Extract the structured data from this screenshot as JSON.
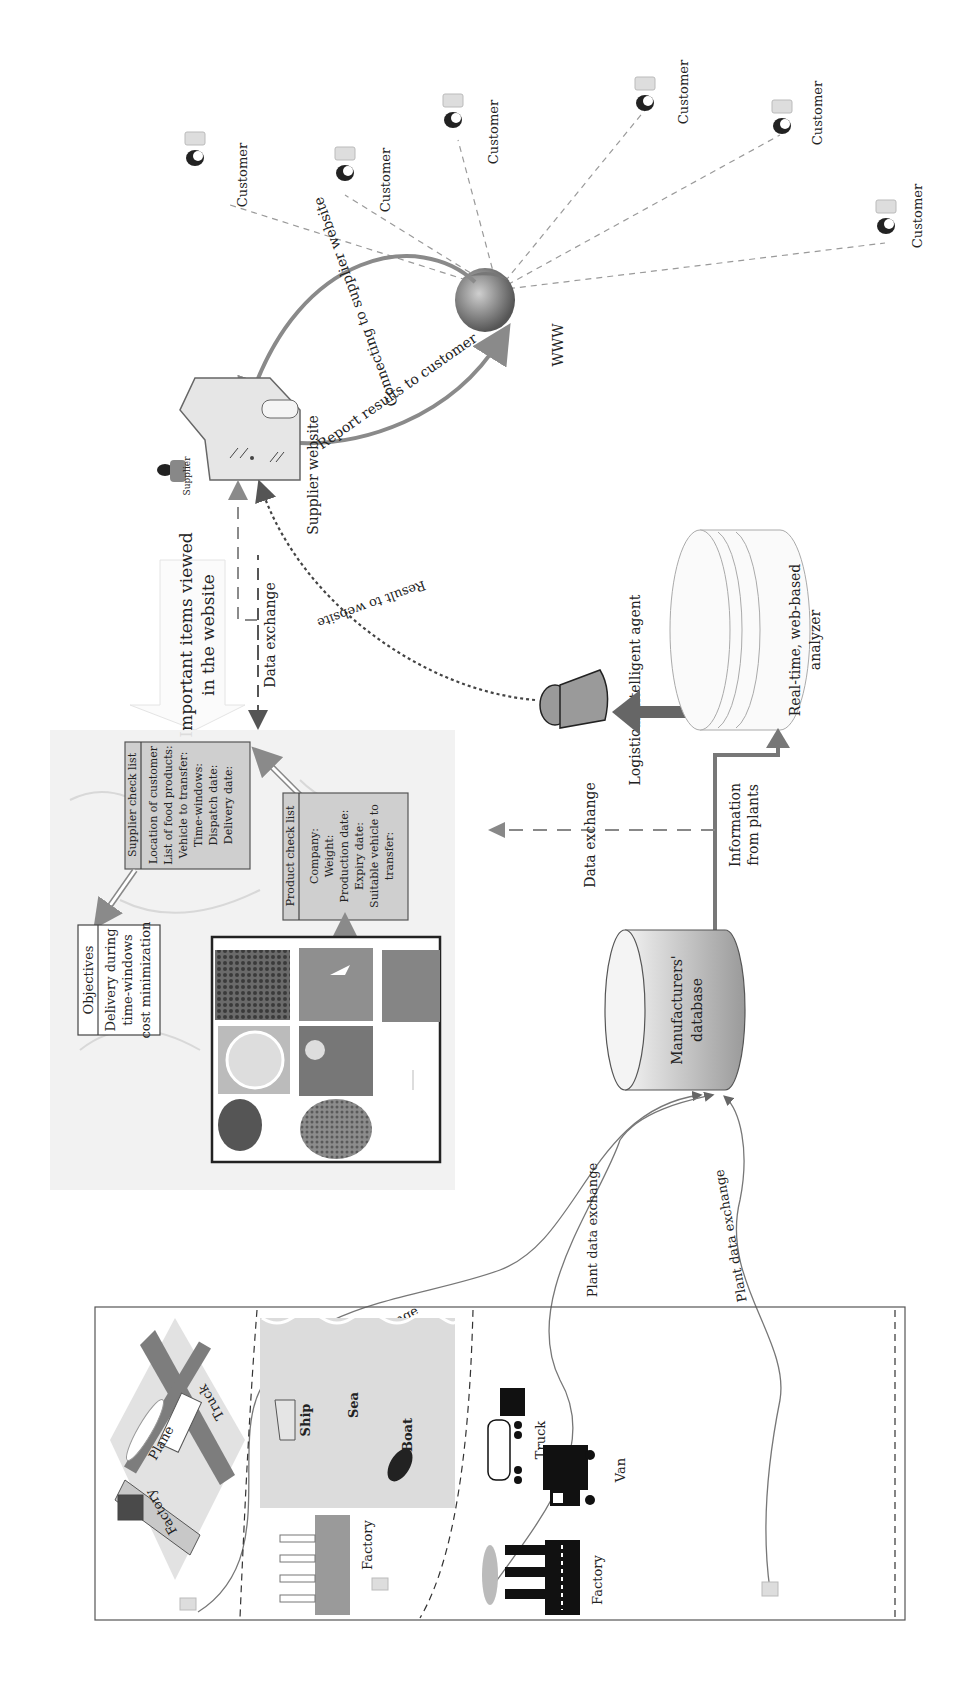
{
  "customers": {
    "label": "Customer",
    "items": [
      {
        "label": "Customer"
      },
      {
        "label": "Customer"
      },
      {
        "label": "Customer"
      },
      {
        "label": "Customer"
      },
      {
        "label": "Customer"
      },
      {
        "label": "Customer"
      }
    ]
  },
  "www": {
    "label": "WWW"
  },
  "arcs": {
    "connecting": "Connecting to supplier website",
    "report": "Report results to customer"
  },
  "supplier": {
    "icon_label": "Supplier",
    "website_label": "Supplier website"
  },
  "important_items": {
    "line1": "Important items viewed",
    "line2": "in the website"
  },
  "data_exchange_top": "Data exchange",
  "result_to_website": "Result to website",
  "agent": {
    "label": "Logistical intelligent agent"
  },
  "analyzer": {
    "line1": "Real-time, web-based",
    "line2": "analyzer"
  },
  "information_from_plants": {
    "line1": "Information",
    "line2": "from plants"
  },
  "data_exchange_mid": "Data exchange",
  "manufacturers_db": {
    "line1": "Manufacturers'",
    "line2": "database"
  },
  "supplier_checklist": {
    "title": "Supplier check list",
    "items": [
      "Location of customer",
      "List of food products:",
      "Vehicle to transfer:",
      "Time-windows:",
      "Dispatch date:",
      "Delivery date:"
    ]
  },
  "product_checklist": {
    "title": "Product check list",
    "items": [
      "Company:",
      "Weight:",
      "Production date:",
      "Expiry date:",
      "Suitable vehicle to",
      "transfer:"
    ]
  },
  "objectives": {
    "title": "Objectives",
    "items": [
      "Delivery during",
      "time-windows",
      "cost minimization"
    ]
  },
  "plant_links": [
    {
      "label": "Plant data exchange"
    },
    {
      "label": "Plant data exchange"
    },
    {
      "label": "Plant data exchange"
    }
  ],
  "zone_air": {
    "factory": "Factory",
    "plane": "Plane",
    "truck": "Truck"
  },
  "zone_sea": {
    "ship": "Ship",
    "sea": "Sea",
    "boat": "Boat",
    "factory": "Factory"
  },
  "zone_land": {
    "truck": "Truck",
    "van": "Van",
    "factory": "Factory"
  },
  "colors": {
    "arrow_gray": "#8a8a8a",
    "box_fill": "#cfcfcf",
    "dark": "#1a1a1a",
    "sea_fill": "#dcdcdc",
    "map_bg": "#f1f1f1"
  }
}
